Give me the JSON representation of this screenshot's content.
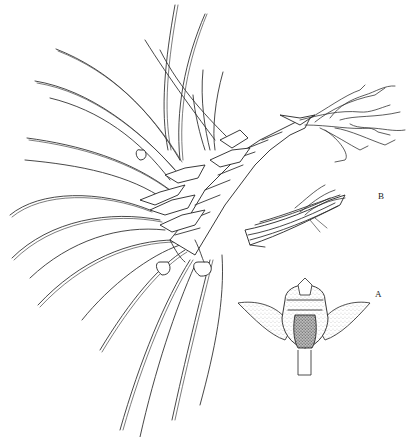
{
  "figure": {
    "labels": [
      {
        "id": "B",
        "text": "B",
        "x": 378,
        "y": 192
      },
      {
        "id": "A",
        "text": "A",
        "x": 375,
        "y": 290
      }
    ],
    "components": [
      {
        "id": "habit",
        "description": "plant habit with long filiform leaves and imbricate stem"
      },
      {
        "id": "A",
        "description": "flower, front view, stippled petals, dark lip"
      },
      {
        "id": "B",
        "description": "detail of stem section with roots"
      }
    ],
    "colors": {
      "background": "#ffffff",
      "ink": "#222222"
    }
  }
}
